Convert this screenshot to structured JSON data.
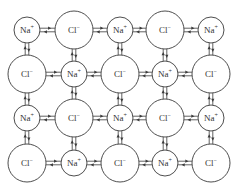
{
  "diagram": {
    "colors": {
      "stroke": "#3a3a3a",
      "text": "#333333",
      "background": "#ffffff"
    },
    "ion_types": {
      "Na": {
        "symbol": "Na",
        "charge": "+",
        "radius": 13
      },
      "Cl": {
        "symbol": "Cl",
        "charge": "−",
        "radius": 19
      }
    },
    "columns_x": [
      27,
      74,
      120,
      165,
      211
    ],
    "rows_y": [
      30,
      74,
      118,
      163
    ],
    "grid": [
      [
        "Na",
        "Cl",
        "Na",
        "Cl",
        "Na"
      ],
      [
        "Cl",
        "Na",
        "Cl",
        "Na",
        "Cl"
      ],
      [
        "Na",
        "Cl",
        "Na",
        "Cl",
        "Na"
      ],
      [
        "Cl",
        "Na",
        "Cl",
        "Na",
        "Cl"
      ]
    ],
    "labels": {
      "Na": "Na+",
      "Cl": "Cl−"
    },
    "connectors": "double opposing arrows between every horizontally and vertically adjacent pair of ions"
  }
}
